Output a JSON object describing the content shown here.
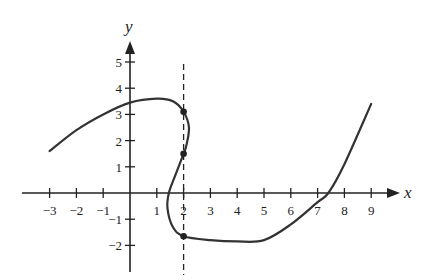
{
  "chart_data": {
    "type": "line",
    "title": "",
    "xlabel": "x",
    "ylabel": "y",
    "xlim": [
      -3.8,
      10
    ],
    "ylim": [
      -2.9,
      6
    ],
    "grid": false,
    "x_ticks": [
      -3,
      -2,
      -1,
      1,
      2,
      3,
      4,
      5,
      6,
      7,
      8,
      9
    ],
    "y_ticks": [
      -2,
      -1,
      1,
      2,
      3,
      4,
      5
    ],
    "x_tick_labels": [
      "−3",
      "−2",
      "−1",
      "1",
      "2",
      "3",
      "4",
      "5",
      "6",
      "7",
      "8",
      "9"
    ],
    "y_tick_labels": [
      "−2",
      "−1",
      "1",
      "2",
      "3",
      "4",
      "5"
    ],
    "series": [
      {
        "name": "curve",
        "description": "Smooth curve (not a function of x) that rises from left, peaks, turns back across x=2, loops left, then passes x=2 again and rises to the right",
        "points": [
          [
            -3,
            1.6
          ],
          [
            -2,
            2.4
          ],
          [
            -1,
            3.0
          ],
          [
            0,
            3.45
          ],
          [
            1,
            3.6
          ],
          [
            1.6,
            3.5
          ],
          [
            2,
            3.1
          ],
          [
            2.2,
            2.5
          ],
          [
            2.1,
            1.8
          ],
          [
            2,
            1.5
          ],
          [
            1.7,
            0.7
          ],
          [
            1.45,
            0
          ],
          [
            1.4,
            -0.6
          ],
          [
            1.6,
            -1.3
          ],
          [
            2,
            -1.65
          ],
          [
            3,
            -1.8
          ],
          [
            4,
            -1.85
          ],
          [
            5,
            -1.8
          ],
          [
            6,
            -1.2
          ],
          [
            7,
            -0.35
          ],
          [
            7.4,
            0
          ],
          [
            8,
            1.1
          ],
          [
            9,
            3.4
          ]
        ]
      }
    ],
    "vertical_line": {
      "x": 2,
      "style": "dashed"
    },
    "marked_points": [
      {
        "x": 2,
        "y": 3.1
      },
      {
        "x": 2,
        "y": 1.5
      },
      {
        "x": 2,
        "y": -1.65
      }
    ]
  },
  "labels": {
    "x_axis": "x",
    "y_axis": "y"
  }
}
